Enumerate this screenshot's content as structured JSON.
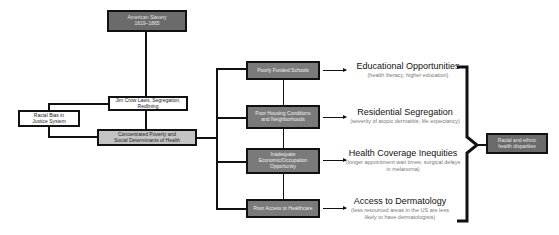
{
  "diagram": {
    "root": {
      "label_line1": "American Slavery",
      "label_line2": "1619–1865"
    },
    "jim_crow": {
      "label_line1": "Jim Crow Laws, Segregation,",
      "label_line2": "Redlining"
    },
    "racial_bias": {
      "label_line1": "Racial Bias in",
      "label_line2": "Justice System"
    },
    "poverty": {
      "label_line1": "Concentrated Poverty and",
      "label_line2": "Social Determinants of Health"
    },
    "factors": [
      {
        "label": "Poorly Funded Schools"
      },
      {
        "label": "Poor Housing Conditions and Neighborhoods"
      },
      {
        "label": "Inadequate Economic/Occupation Opportunity"
      },
      {
        "label": "Poor Access to Healthcare"
      }
    ],
    "outcomes": [
      {
        "title": "Educational Opportunities",
        "detail": "(health literacy, higher education)"
      },
      {
        "title": "Residential Segregation",
        "detail": "(severity of atopic dermatitis; life expectancy)"
      },
      {
        "title": "Health Coverage Inequities",
        "detail": "(longer appointment wait times; surgical delays in melanoma)"
      },
      {
        "title": "Access to Dermatology",
        "detail": "(less resourced areas in the US are less likely to have dermatologists)"
      }
    ],
    "result": {
      "label": "Racial and ethnic health disparities"
    }
  }
}
